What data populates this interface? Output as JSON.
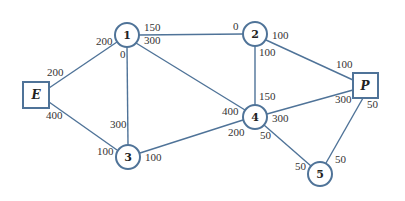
{
  "diagram": {
    "type": "network-flow",
    "colors": {
      "line": "#4f7398",
      "text": "#333333"
    },
    "nodes": [
      {
        "id": "E",
        "label": "E",
        "shape": "box",
        "x": 36,
        "y": 95
      },
      {
        "id": "1",
        "label": "1",
        "shape": "circle",
        "x": 127,
        "y": 35
      },
      {
        "id": "2",
        "label": "2",
        "shape": "circle",
        "x": 255,
        "y": 34
      },
      {
        "id": "3",
        "label": "3",
        "shape": "circle",
        "x": 128,
        "y": 157
      },
      {
        "id": "4",
        "label": "4",
        "shape": "circle",
        "x": 255,
        "y": 117
      },
      {
        "id": "5",
        "label": "5",
        "shape": "circle",
        "x": 320,
        "y": 174
      },
      {
        "id": "P",
        "label": "P",
        "shape": "box",
        "x": 365,
        "y": 85
      }
    ],
    "edges": [
      {
        "from": "E",
        "to": "1",
        "cap_from": "200",
        "cap_to": "200"
      },
      {
        "from": "E",
        "to": "3",
        "cap_from": "400",
        "cap_to": "100"
      },
      {
        "from": "1",
        "to": "2",
        "cap_from": "150",
        "cap_to": "0"
      },
      {
        "from": "1",
        "to": "3",
        "cap_from": "0",
        "cap_to": "300"
      },
      {
        "from": "1",
        "to": "4",
        "cap_from": "300",
        "cap_to": "400"
      },
      {
        "from": "2",
        "to": "4",
        "cap_from": "100",
        "cap_to": "150"
      },
      {
        "from": "2",
        "to": "P",
        "cap_from": "100",
        "cap_to": "100"
      },
      {
        "from": "3",
        "to": "4",
        "cap_from": "100",
        "cap_to": "200"
      },
      {
        "from": "4",
        "to": "P",
        "cap_from": "300",
        "cap_to": "300"
      },
      {
        "from": "4",
        "to": "5",
        "cap_from": "50",
        "cap_to": "50"
      },
      {
        "from": "P",
        "to": "5",
        "cap_from": "50",
        "cap_to": "50"
      }
    ]
  },
  "labels": {
    "E": "E",
    "P": "P",
    "n1": "1",
    "n2": "2",
    "n3": "3",
    "n4": "4",
    "n5": "5",
    "e_E1_E": "200",
    "e_E1_1": "200",
    "e_E3_E": "400",
    "e_E3_3": "100",
    "e_12_1": "150",
    "e_12_2": "0",
    "e_13_1": "0",
    "e_13_3": "300",
    "e_14_1": "300",
    "e_14_4": "400",
    "e_24_2": "100",
    "e_24_4": "150",
    "e_2P_2": "100",
    "e_2P_P": "100",
    "e_34_3": "100",
    "e_34_4": "200",
    "e_4P_4": "300",
    "e_4P_P": "300",
    "e_45_4": "50",
    "e_45_5": "50",
    "e_P5_P": "50",
    "e_P5_5": "50"
  }
}
